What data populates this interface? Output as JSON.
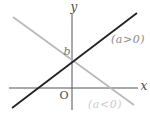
{
  "chart_data": {
    "type": "line",
    "title": "",
    "xlabel": "x",
    "ylabel": "y",
    "series": [
      {
        "name": "(a>0)",
        "slope_sign": "positive",
        "y_intercept": "b"
      },
      {
        "name": "(a<0)",
        "slope_sign": "negative",
        "y_intercept": "b"
      }
    ],
    "annotations": [
      "y",
      "x",
      "O",
      "b",
      "(a>0)",
      "(a<0)"
    ],
    "axis_ranges": "unlabeled schematic axes, no numeric ticks, no grid",
    "legend_position": "labels placed beside each line"
  },
  "figure": {
    "background": "#ffffff",
    "axes": {
      "color": "#555555",
      "label_color": "#4a4a4a",
      "stroke_width": 1,
      "x_axis": {
        "x1": 9,
        "y1": 88,
        "x2": 138,
        "y2": 88
      },
      "y_axis": {
        "x1": 72,
        "y1": 14,
        "x2": 72,
        "y2": 110
      },
      "x_label": {
        "text": "x",
        "x": 144,
        "y": 90
      },
      "y_label": {
        "text": "y",
        "x": 74,
        "y": 11
      },
      "origin_label": {
        "text": "O",
        "x": 64,
        "y": 99
      }
    },
    "lines": [
      {
        "name": "a-negative",
        "x1": 13,
        "y1": 17,
        "x2": 134,
        "y2": 105,
        "color": "#b8b8b8",
        "width": 1.6,
        "label": "(a<0)",
        "label_color": "#cbcbcb",
        "label_x": 105,
        "label_y": 108
      },
      {
        "name": "a-positive",
        "x1": 12,
        "y1": 108,
        "x2": 137,
        "y2": 13,
        "color": "#222222",
        "width": 1.8,
        "label": "(a>0)",
        "label_color": "#8a8a8a",
        "label_x": 128,
        "label_y": 43
      }
    ],
    "intercept_label": {
      "text": "b",
      "x": 67,
      "y": 55,
      "color": "#777777"
    }
  }
}
